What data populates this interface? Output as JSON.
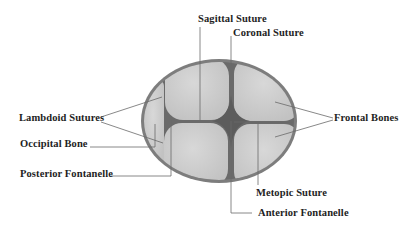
{
  "colors": {
    "background": "#ffffff",
    "skull_rim": "#7a7a7a",
    "bone_fill": "#c9c9c9",
    "bone_highlight": "#d6d6d6",
    "fontanelle": "#5f5f5f",
    "leader_line": "#6a6a6a",
    "label_text": "#1e1e1e"
  },
  "labels": {
    "sagittal_suture": "Sagittal Suture",
    "coronal_suture": "Coronal Suture",
    "lambdoid_sutures": "Lambdoid Sutures",
    "occipital_bone": "Occipital Bone",
    "posterior_fontanelle": "Posterior Fontanelle",
    "frontal_bones": "Frontal Bones",
    "metopic_suture": "Metopic Suture",
    "anterior_fontanelle": "Anterior Fontanelle"
  }
}
